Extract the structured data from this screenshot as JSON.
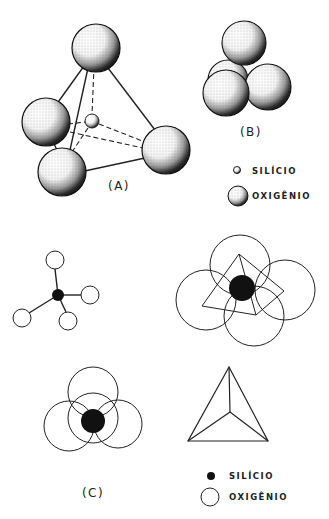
{
  "figure": {
    "panel_a": {
      "label": "(A)",
      "description": "3D tetrahedron of four oxygen spheres around a central silicon atom"
    },
    "panel_b": {
      "label": "(B)",
      "description": "Close-packed cluster of four oxygen spheres"
    },
    "legend_top": {
      "silicon": "SILÍCIO",
      "oxygen": "OXIGÊNIO"
    },
    "panel_c": {
      "label": "(C)",
      "description": "2D schematic views of the SiO4 tetrahedron"
    },
    "legend_bottom": {
      "silicon": "SILÍCIO",
      "oxygen": "OXIGÊNIO"
    }
  },
  "colors": {
    "ink": "#222222",
    "background": "#ffffff"
  }
}
